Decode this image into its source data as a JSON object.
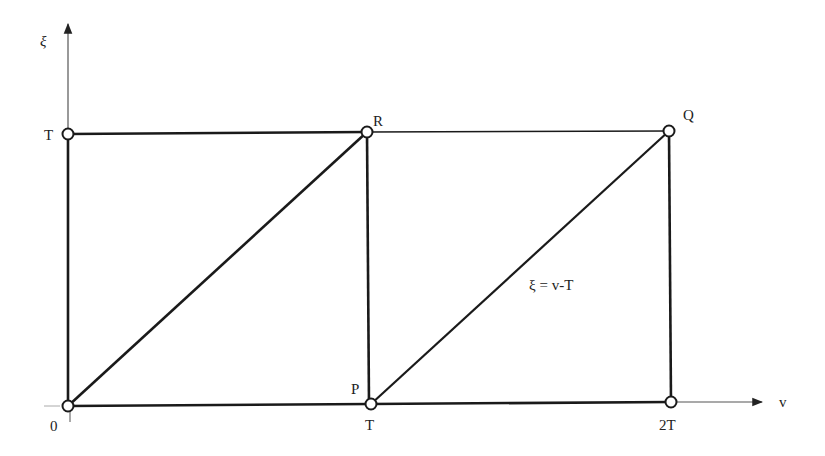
{
  "diagram": {
    "axes": {
      "vertical_label": "ξ",
      "horizontal_label": "v"
    },
    "tick_labels": {
      "origin": "0",
      "xi_T": "T",
      "v_T": "T",
      "v_2T": "2T"
    },
    "points": {
      "R": "R",
      "Q": "Q",
      "P": "P"
    },
    "line_label": "ξ = v-T",
    "colors": {
      "stroke": "#1a1a1a",
      "thin_axis": "#555555",
      "background": "#ffffff"
    }
  }
}
